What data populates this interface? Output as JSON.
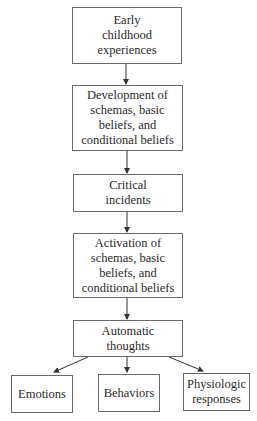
{
  "diagram": {
    "type": "flowchart",
    "nodes": [
      {
        "id": "early-childhood",
        "label": "Early\nchildhood\nexperiences"
      },
      {
        "id": "development",
        "label": "Development of\nschemas, basic\nbeliefs, and\nconditional beliefs"
      },
      {
        "id": "critical-incidents",
        "label": "Critical\nincidents"
      },
      {
        "id": "activation",
        "label": "Activation of\nschemas, basic\nbeliefs, and\nconditional beliefs"
      },
      {
        "id": "automatic-thoughts",
        "label": "Automatic\nthoughts"
      },
      {
        "id": "emotions",
        "label": "Emotions"
      },
      {
        "id": "behaviors",
        "label": "Behaviors"
      },
      {
        "id": "physiologic",
        "label": "Physiologic\nresponses"
      }
    ],
    "edges": [
      {
        "from": "early-childhood",
        "to": "development"
      },
      {
        "from": "development",
        "to": "critical-incidents"
      },
      {
        "from": "critical-incidents",
        "to": "activation"
      },
      {
        "from": "activation",
        "to": "automatic-thoughts"
      },
      {
        "from": "automatic-thoughts",
        "to": "emotions"
      },
      {
        "from": "automatic-thoughts",
        "to": "behaviors"
      },
      {
        "from": "automatic-thoughts",
        "to": "physiologic"
      }
    ],
    "colors": {
      "border": "#6a6a6a",
      "arrow": "#333333",
      "text": "#2a2a2a",
      "background": "#ffffff"
    }
  }
}
